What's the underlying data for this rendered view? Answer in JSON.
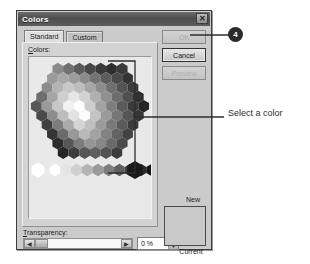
{
  "dialog": {
    "title": "Colors",
    "close_icon": "close-icon",
    "tabs": [
      {
        "label": "Standard",
        "selected": true
      },
      {
        "label": "Custom",
        "selected": false
      }
    ],
    "colors_label": "Colors:",
    "colors_label_accesskey": "C",
    "transparency_label": "Transparency:",
    "transparency_label_accesskey": "T",
    "transparency_value": "0 %",
    "slider": {
      "left_arrow": "◀",
      "right_arrow": "▶",
      "position_percent": 0
    },
    "spinner": {
      "up_arrow": "▲",
      "down_arrow": "▼"
    },
    "buttons": [
      {
        "name": "ok",
        "label": "OK",
        "enabled": false
      },
      {
        "name": "cancel",
        "label": "Cancel",
        "enabled": true
      },
      {
        "name": "preview",
        "label": "Preview",
        "enabled": false
      }
    ],
    "preview": {
      "new_label": "New",
      "current_label": "Current",
      "swatch_color": "#c9c9c9"
    }
  },
  "annotations": {
    "badge_number": "4",
    "callout_text": "Select a color"
  },
  "palette": {
    "selected_swatch_color": "#1a1a1a",
    "honeycomb_rows": [
      [
        "#8a8a8a",
        "#707070",
        "#5a5a5a",
        "#484848",
        "#3a3a3a",
        "#2e2e2e",
        "#3c3c3c"
      ],
      [
        "#9a9a9a",
        "#a8a8a8",
        "#9d9d9d",
        "#8b8b8b",
        "#747474",
        "#5c5c5c",
        "#4a4a4a",
        "#343434"
      ],
      [
        "#8c8c8c",
        "#b4b4b4",
        "#c8c8c8",
        "#bdbdbd",
        "#a6a6a6",
        "#8d8d8d",
        "#6f6f6f",
        "#535353",
        "#3b3b3b"
      ],
      [
        "#6e6e6e",
        "#a5a5a5",
        "#cfcfcf",
        "#e6e6e6",
        "#d2d2d2",
        "#b0b0b0",
        "#909090",
        "#6d6d6d",
        "#4f4f4f",
        "#2f2f2f"
      ],
      [
        "#585858",
        "#9a9a9a",
        "#c6c6c6",
        "#f2f2f2",
        "#ffffff",
        "#cdcdcd",
        "#a3a3a3",
        "#7e7e7e",
        "#5a5a5a",
        "#3a3a3a",
        "#262626"
      ],
      [
        "#4a4a4a",
        "#8d8d8d",
        "#bdbdbd",
        "#e2e2e2",
        "#fbfbfb",
        "#c4c4c4",
        "#9b9b9b",
        "#767676",
        "#555555",
        "#373737"
      ],
      [
        "#3e3e3e",
        "#7c7c7c",
        "#ababab",
        "#d4d4d4",
        "#c0c0c0",
        "#9c9c9c",
        "#7a7a7a",
        "#5a5a5a",
        "#3c3c3c"
      ],
      [
        "#343434",
        "#6a6a6a",
        "#989898",
        "#b8b8b8",
        "#a2a2a2",
        "#828282",
        "#626262",
        "#424242"
      ],
      [
        "#2c2c2c",
        "#565656",
        "#7c7c7c",
        "#959595",
        "#868686",
        "#6a6a6a",
        "#4b4b4b"
      ],
      [
        "#262626",
        "#3e3e3e",
        "#565656",
        "#5f5f5f",
        "#525252",
        "#3c3c3c"
      ]
    ],
    "gray_ramp": [
      "#ffffff",
      "#e4e4e4",
      "#cfcfcf",
      "#b4b4b4",
      "#9a9a9a",
      "#7d7d7d",
      "#5f5f5f",
      "#434343",
      "#2a2a2a",
      "#141414"
    ]
  }
}
